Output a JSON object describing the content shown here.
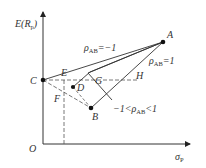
{
  "diagram": {
    "y_axis_label": "E(R",
    "y_axis_label_sub": "p",
    "y_axis_label_close": ")",
    "x_axis_label": "σ",
    "x_axis_label_sub": "P",
    "origin_label": "O",
    "points": {
      "A": "A",
      "B": "B",
      "C": "C",
      "D": "D",
      "E": "E",
      "F": "F",
      "G": "G",
      "H": "H"
    },
    "annotations": {
      "rho_neg1_prefix": "ρ",
      "rho_neg1_sub": "AB",
      "rho_neg1_suffix": "=−1",
      "rho_pos1_prefix": "ρ",
      "rho_pos1_sub": "AB",
      "rho_pos1_suffix": "=1",
      "rho_mid_prefix": "−1<ρ",
      "rho_mid_sub": "AB",
      "rho_mid_suffix": "<1"
    },
    "colors": {
      "line": "#333333",
      "dash": "#555555"
    }
  }
}
